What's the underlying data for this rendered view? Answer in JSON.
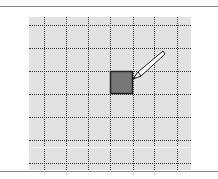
{
  "figure": {
    "colors": {
      "background": "#ffffff",
      "grid_fill": "#e2e2e2",
      "grid_lines": "#333333",
      "selected_cell_fill": "#777777",
      "selected_cell_border": "#222222",
      "pencil_fill": "#ffffff",
      "pencil_outline": "#222222"
    },
    "grid": {
      "columns": 7,
      "rows": 7,
      "selected_cell": {
        "column": 4,
        "row": 3
      }
    },
    "icons": [
      "pencil-icon"
    ]
  }
}
